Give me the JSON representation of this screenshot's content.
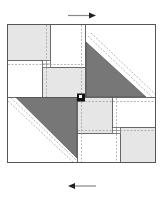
{
  "diagram": {
    "type": "quilt-block",
    "colors": {
      "background": "#ffffff",
      "outline": "#555555",
      "light_fill": "#e6e6e6",
      "white_fill": "#ffffff",
      "dark_fill": "#777777",
      "seam_dash": "#999999",
      "center_square": "#111111",
      "arrow": "#222222",
      "arrow_shaft": "#888888"
    },
    "arrows": [
      {
        "name": "top-arrow",
        "direction": "right"
      },
      {
        "name": "bottom-arrow",
        "direction": "left"
      }
    ]
  }
}
